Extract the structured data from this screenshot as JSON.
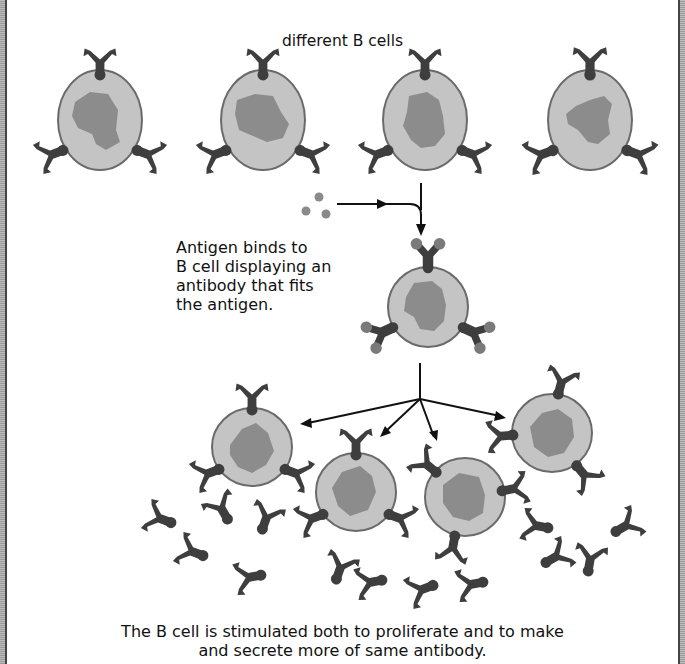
{
  "labels": {
    "top": "different B cells",
    "antigen_binding": [
      "Antigen binds to",
      "B cell displaying an",
      "antibody that fits",
      "the antigen."
    ],
    "caption": [
      "The B cell is stimulated both to proliferate and to make",
      "and secrete more of same antibody."
    ]
  },
  "colors": {
    "cell_fill": "#c4c4c4",
    "cell_outline": "#6a6a6a",
    "nucleus": "#8c8c8c",
    "antibody": "#3e3e3e",
    "antigen": "#8a8a8a",
    "arrow": "#111111",
    "frame": "#a8a8a8"
  },
  "diagram": {
    "top_cells_count": 4,
    "selected_cell_count": 1,
    "daughter_cells_count": 4,
    "free_antibodies_count": 17,
    "antigen_particles_count": 3
  }
}
